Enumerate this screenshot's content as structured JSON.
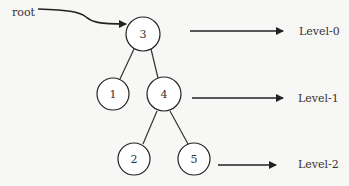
{
  "diagram": {
    "type": "binary-tree",
    "root_label": "root",
    "nodes": [
      {
        "id": "n3",
        "value": "3",
        "level": 0
      },
      {
        "id": "n1",
        "value": "1",
        "level": 1
      },
      {
        "id": "n4",
        "value": "4",
        "level": 1
      },
      {
        "id": "n2",
        "value": "2",
        "level": 2
      },
      {
        "id": "n5",
        "value": "5",
        "level": 2
      }
    ],
    "edges": [
      {
        "from": "3",
        "to": "1"
      },
      {
        "from": "3",
        "to": "4"
      },
      {
        "from": "4",
        "to": "2"
      },
      {
        "from": "4",
        "to": "5"
      }
    ],
    "levels": [
      {
        "label": "Level-0"
      },
      {
        "label": "Level-1"
      },
      {
        "label": "Level-2"
      }
    ],
    "colors": {
      "background": "#f7f7f5",
      "stroke": "#222222",
      "text": "#333333"
    }
  }
}
